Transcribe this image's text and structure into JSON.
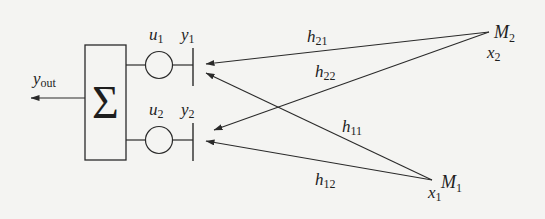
{
  "diagram": {
    "type": "signal-flow / MIMO combining diagram",
    "summer": {
      "symbol": "Σ"
    },
    "output": {
      "label_base": "y",
      "label_sub": "out"
    },
    "branches": [
      {
        "weight_base": "u",
        "weight_sub": "1",
        "receiver_base": "y",
        "receiver_sub": "1"
      },
      {
        "weight_base": "u",
        "weight_sub": "2",
        "receiver_base": "y",
        "receiver_sub": "2"
      }
    ],
    "sources": [
      {
        "name_base": "M",
        "name_sub": "1",
        "signal_base": "x",
        "signal_sub": "1"
      },
      {
        "name_base": "M",
        "name_sub": "2",
        "signal_base": "x",
        "signal_sub": "2"
      }
    ],
    "channels": [
      {
        "base": "h",
        "sub": "21",
        "from": "M2",
        "to": "y1"
      },
      {
        "base": "h",
        "sub": "22",
        "from": "M2",
        "to": "y2"
      },
      {
        "base": "h",
        "sub": "11",
        "from": "M1",
        "to": "y1"
      },
      {
        "base": "h",
        "sub": "12",
        "from": "M1",
        "to": "y2"
      }
    ],
    "colors": {
      "ink": "#2a2a2a",
      "background": "#f4f4f2"
    }
  }
}
